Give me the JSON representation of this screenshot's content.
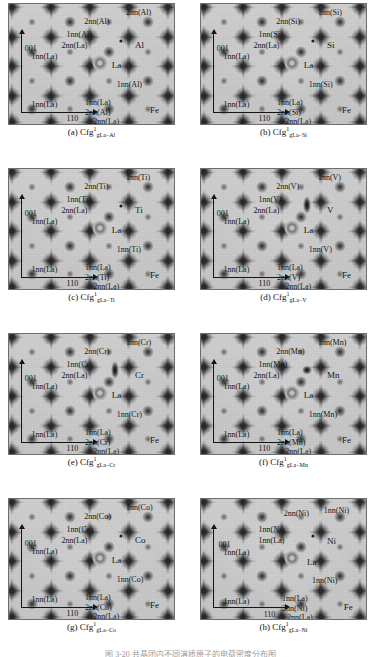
{
  "figure": {
    "columns": 2,
    "rows": 4,
    "bottom_partial_caption": "图 3-20  共晶团内不同溶质原子的电荷密度分布图"
  },
  "axis_labels": {
    "vertical": "001",
    "horizontal": "110"
  },
  "common_labels": {
    "la": "La",
    "fe": "Fe",
    "inn_la": "1nn(La)",
    "2nn_la": "2nn(La)"
  },
  "colors": {
    "map_background": "#c8c8c8",
    "frame": "#6e6e6e",
    "ink": "#111111"
  },
  "panels": [
    {
      "id": "a",
      "solute": "Al",
      "caption_prefix": "(a)",
      "caption_base": "Cfg",
      "caption_sup": "1",
      "caption_sub": "gLa−Al",
      "labels": {
        "top_right": "2nn(Al)",
        "top_mid": "2nn(Al)",
        "inn_solute_top": "1nn(Al)",
        "second_la": "2nn(La)",
        "solute": "Al",
        "inn_la_left": "1nn(La)",
        "la": "La",
        "inn_solute_right": "1nn(Al)",
        "inn_la_bottom_left": "1nn(La)",
        "inn_la_bottom_mid": "1nn(La)",
        "2nn_solute_bottom": "2nn(Al)",
        "fe": "Fe",
        "axis_v": "001",
        "axis_h": "110",
        "2nn_la_bottom": "2nn(La)"
      }
    },
    {
      "id": "b",
      "solute": "Si",
      "caption_prefix": "(b)",
      "caption_base": "Cfg",
      "caption_sup": "1",
      "caption_sub": "gLa−Si",
      "labels": {
        "top_right": "1nn(Si)",
        "top_mid": "2nn(Si)",
        "inn_solute_top": "1nn(Si)",
        "second_la": "2nn(La)",
        "solute": "Si",
        "inn_la_left": "1nn(La)",
        "la": "La",
        "inn_solute_right": "1nn(Si)",
        "inn_la_bottom_left": "1nn(La)",
        "inn_la_bottom_mid": "1nn(La)",
        "2nn_solute_bottom": "2nn(Si)",
        "fe": "Fe",
        "axis_v": "001",
        "axis_h": "110",
        "2nn_la_bottom": "2nn(La)"
      }
    },
    {
      "id": "c",
      "solute": "Ti",
      "caption_prefix": "(c)",
      "caption_base": "Cfg",
      "caption_sup": "1",
      "caption_sub": "gLa−Ti",
      "labels": {
        "top_right": "1nn(Ti)",
        "top_mid": "2nn(Ti)",
        "inn_solute_top": "1nn(Ti)",
        "second_la": "2nn(La)",
        "solute": "Ti",
        "inn_la_left": "1nn(La)",
        "la": "La",
        "inn_solute_right": "1nn(Ti)",
        "inn_la_bottom_left": "1nn(La)",
        "inn_la_bottom_mid": "1nn(La)",
        "2nn_solute_bottom": "2nn(Ti)",
        "fe": "Fe",
        "axis_v": "001",
        "axis_h": "110",
        "2nn_la_bottom": "2nn(La)"
      }
    },
    {
      "id": "d",
      "solute": "V",
      "caption_prefix": "(d)",
      "caption_base": "Cfg",
      "caption_sup": "1",
      "caption_sub": "gLa−V",
      "labels": {
        "top_right": "1nn(V)",
        "top_mid": "2nn(V)",
        "inn_solute_top": "1nn(V)",
        "second_la": "2nn(La)",
        "solute": "V",
        "inn_la_left": "1nn(La)",
        "la": "La",
        "inn_solute_right": "1nn(V)",
        "inn_la_bottom_left": "1nn(La)",
        "inn_la_bottom_mid": "1nn(La)",
        "2nn_solute_bottom": "2nn(V)",
        "fe": "Fe",
        "axis_v": "001",
        "axis_h": "110",
        "2nn_la_bottom": "2nn(La)"
      }
    },
    {
      "id": "e",
      "solute": "Cr",
      "caption_prefix": "(e)",
      "caption_base": "Cfg",
      "caption_sup": "1",
      "caption_sub": "gLa−Cr",
      "labels": {
        "top_right": "1nn(Cr)",
        "top_mid": "2nn(Cr)",
        "inn_solute_top": "1nn(Cr)",
        "second_la": "2nn(La)",
        "solute": "Cr",
        "inn_la_left": "1nn(La)",
        "la": "La",
        "inn_solute_right": "1nn(Cr)",
        "inn_la_bottom_left": "1nn(La)",
        "inn_la_bottom_mid": "1nn(La)",
        "2nn_solute_bottom": "2nn(Cr)",
        "fe": "Fe",
        "axis_v": "001",
        "axis_h": "110",
        "2nn_la_bottom": "2nn(La)"
      }
    },
    {
      "id": "f",
      "solute": "Mn",
      "caption_prefix": "(f)",
      "caption_base": "Cfg",
      "caption_sup": "1",
      "caption_sub": "gLa−Mn",
      "labels": {
        "top_right": "1nn(Mn)",
        "top_mid": "2nn(Mn)",
        "inn_solute_top": "1nn(Mn)",
        "second_la": "2nn(La)",
        "solute": "Mn",
        "inn_la_left": "1nn(La)",
        "la": "La",
        "inn_solute_right": "1nn(Mn)",
        "inn_la_bottom_left": "1nn(La)",
        "inn_la_bottom_mid": "1nn(La)",
        "2nn_solute_bottom": "2nn(Mn)",
        "fe": "Fe",
        "axis_v": "001",
        "axis_h": "110",
        "2nn_la_bottom": "2nn(La)"
      }
    },
    {
      "id": "g",
      "solute": "Co",
      "caption_prefix": "(g)",
      "caption_base": "Cfg",
      "caption_sup": "1",
      "caption_sub": "gLa−Co",
      "labels": {
        "top_right": "1nn(Co)",
        "top_mid": "2nn(Co)",
        "inn_solute_top": "1nn(Co)",
        "second_la": "2nn(La)",
        "solute": "Co",
        "inn_la_left": "1nn(La)",
        "la": "La",
        "inn_solute_right": "1nn(Co)",
        "inn_la_bottom_left": "1nn(La)",
        "inn_la_bottom_mid": "1nn(La)",
        "2nn_solute_bottom": "2nn(Co)",
        "fe": "Fe",
        "axis_v": "001",
        "axis_h": "110",
        "2nn_la_bottom": "2nn(La)"
      }
    },
    {
      "id": "h",
      "solute": "Ni",
      "caption_prefix": "(h)",
      "caption_base": "Cfg",
      "caption_sup": "1",
      "caption_sub": "gLa−Ni",
      "labels": {
        "top_right": "1nn(Ni)",
        "top_mid": "2nn(Ni)",
        "inn_solute_top": "1nn(Ni)",
        "second_la": "1nn(La)",
        "solute": "Ni",
        "inn_la_left": "1nn(La)",
        "la": "La",
        "inn_solute_right": "1nn(Ni)",
        "inn_la_bottom_left": "1nn(La)",
        "inn_la_bottom_mid": "1nn(La)",
        "2nn_solute_bottom": "2nn(Ni)",
        "fe": "Fe",
        "axis_v": "001",
        "axis_h": "110",
        "2nn_la_bottom": "2nn(La)"
      }
    }
  ]
}
